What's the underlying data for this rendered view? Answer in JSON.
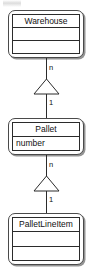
{
  "diagram": {
    "type": "uml-class-diagram",
    "background_color": "#ffffff",
    "line_color": "#2b2b2b",
    "text_color": "#111111"
  },
  "classes": [
    {
      "id": "warehouse",
      "name": "Warehouse",
      "attributes": [],
      "empty_compartments": 2
    },
    {
      "id": "pallet",
      "name": "Pallet",
      "attributes": [
        "number"
      ],
      "empty_compartments": 0
    },
    {
      "id": "palletlineitem",
      "name": "PalletLineItem",
      "attributes": [],
      "empty_compartments": 2
    }
  ],
  "relationships": [
    {
      "id": "warehouse-pallet",
      "from": "Warehouse",
      "to": "Pallet",
      "arrow": "hollow-triangle",
      "direction": "up",
      "source_multiplicity": "n",
      "target_multiplicity": "1"
    },
    {
      "id": "pallet-palletlineitem",
      "from": "Pallet",
      "to": "PalletLineItem",
      "arrow": "hollow-triangle",
      "direction": "up",
      "source_multiplicity": "n",
      "target_multiplicity": "1"
    }
  ]
}
